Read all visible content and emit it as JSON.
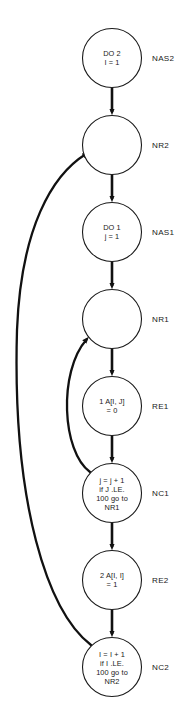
{
  "diagram": {
    "type": "program-flowchart",
    "background_color": "#ffffff",
    "stroke_color": "#111111",
    "node_fill": "#ffffff",
    "nodes": [
      {
        "id": "NAS2",
        "label": "NAS2",
        "cx": 112,
        "cy": 58,
        "r": 29.5,
        "lines": [
          "DO 2",
          "I = 1"
        ]
      },
      {
        "id": "NR2",
        "label": "NR2",
        "cx": 112,
        "cy": 145,
        "r": 29.5,
        "lines": []
      },
      {
        "id": "NAS1",
        "label": "NAS1",
        "cx": 112,
        "cy": 232,
        "r": 29.5,
        "lines": [
          "DO 1",
          "j = 1"
        ]
      },
      {
        "id": "NR1",
        "label": "NR1",
        "cx": 112,
        "cy": 319,
        "r": 29.5,
        "lines": []
      },
      {
        "id": "RE1",
        "label": "RE1",
        "cx": 112,
        "cy": 406,
        "r": 29.5,
        "lines": [
          "1 A[I, J]",
          "= 0"
        ]
      },
      {
        "id": "NC1",
        "label": "NC1",
        "cx": 112,
        "cy": 493,
        "r": 29.5,
        "lines": [
          "j = j + 1",
          "if J .LE.",
          "100 go to",
          "NR1"
        ]
      },
      {
        "id": "RE2",
        "label": "RE2",
        "cx": 112,
        "cy": 580,
        "r": 29.5,
        "lines": [
          "2 A[I, I]",
          "= 1"
        ]
      },
      {
        "id": "NC2",
        "label": "NC2",
        "cx": 112,
        "cy": 667,
        "r": 29.5,
        "lines": [
          "I = I + 1",
          "if I .LE.",
          "100 go to",
          "NR2"
        ]
      }
    ],
    "edges": [
      {
        "from": "NAS2",
        "to": "NR2",
        "kind": "straight"
      },
      {
        "from": "NR2",
        "to": "NAS1",
        "kind": "straight"
      },
      {
        "from": "NAS1",
        "to": "NR1",
        "kind": "straight"
      },
      {
        "from": "NR1",
        "to": "RE1",
        "kind": "straight"
      },
      {
        "from": "RE1",
        "to": "NC1",
        "kind": "straight"
      },
      {
        "from": "NC1",
        "to": "RE2",
        "kind": "straight"
      },
      {
        "from": "RE2",
        "to": "NC2",
        "kind": "straight"
      },
      {
        "from": "NC1",
        "to": "NR1",
        "kind": "feedback-inner"
      },
      {
        "from": "NC2",
        "to": "NR2",
        "kind": "feedback-outer"
      }
    ],
    "label_x": 152
  }
}
